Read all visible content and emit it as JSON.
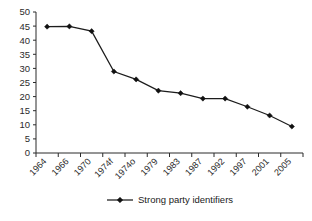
{
  "chart_data": {
    "type": "line",
    "title": "",
    "subtitle": "",
    "xlabel": "",
    "ylabel": "",
    "categories": [
      "1964",
      "1966",
      "1970",
      "1974f",
      "1974o",
      "1979",
      "1983",
      "1987",
      "1992",
      "1997",
      "2001",
      "2005"
    ],
    "series": [
      {
        "name": "Strong party identifiers",
        "values": [
          44.8,
          44.9,
          43.2,
          28.9,
          26.1,
          22.1,
          21.2,
          19.3,
          19.3,
          16.4,
          13.3,
          9.4
        ],
        "color": "#1c1c1c",
        "marker": "diamond"
      }
    ],
    "ylim": [
      0,
      50
    ],
    "ytick_step": 5,
    "ytick_labels": [
      "50",
      "45",
      "40",
      "35",
      "30",
      "25",
      "20",
      "15",
      "10",
      "5",
      "0"
    ],
    "grid": false,
    "legend_position": "bottom",
    "legend_entries": [
      "Strong party identifiers"
    ],
    "xtick_label_rotation": -45
  },
  "legend": {
    "entry_label": "Strong party identifiers"
  },
  "colors": {
    "series": "#1c1c1c",
    "axis": "#2b2b2b",
    "background": "#ffffff",
    "text": "#1a1a1a"
  }
}
